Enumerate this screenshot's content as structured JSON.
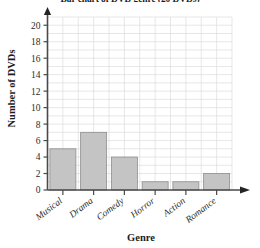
{
  "chart_data": {
    "type": "bar",
    "title": "Bar chart of DVD genre (20 DVDs)",
    "xlabel": "Genre",
    "ylabel": "Number of DVDs",
    "categories": [
      "Musical",
      "Drama",
      "Comedy",
      "Horror",
      "Action",
      "Romance"
    ],
    "values": [
      5,
      7,
      4,
      1,
      1,
      2
    ],
    "ylim": [
      0,
      21
    ],
    "ytick_labels": [
      "0",
      "2",
      "4",
      "6",
      "8",
      "10",
      "12",
      "14",
      "16",
      "18",
      "20"
    ],
    "ytick_values": [
      0,
      2,
      4,
      6,
      8,
      10,
      12,
      14,
      16,
      18,
      20
    ],
    "grid": true,
    "legend": "none",
    "bar_color": "#c4c4c4",
    "bar_edge_color": "#8e8e8e",
    "grid_color": "#dcdcdc",
    "axis_color": "#4a4a4a",
    "xtick_label_rotation": "-37"
  },
  "axes": {
    "y_arrow": "arrow-up-icon",
    "x_arrow": "arrow-right-icon"
  }
}
